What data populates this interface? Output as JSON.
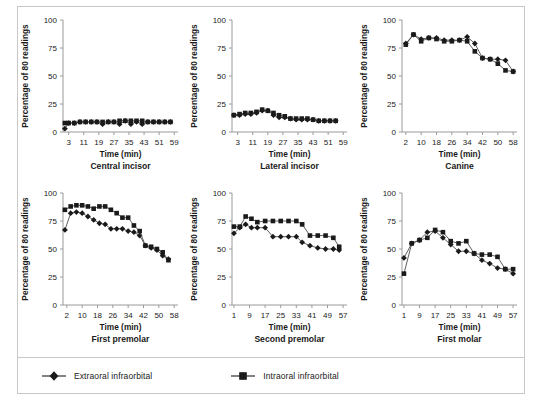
{
  "figure": {
    "ylabel": "Percentage of 80 readings",
    "xlabel": "Time (min)",
    "yticks": [
      "0",
      "25",
      "50",
      "75",
      "100"
    ],
    "ylim": [
      0,
      100
    ],
    "colors": {
      "line": "#4d4d4d",
      "marker": "#1a1a1a",
      "axis": "#9a9a9a",
      "text": "#1a1a1a",
      "border": "#c8c8c8",
      "background": "#ffffff"
    }
  },
  "legend": {
    "position": "bottom",
    "items": [
      {
        "label": "Extraoral infraorbital",
        "marker": "diamond"
      },
      {
        "label": "Intraoral infraorbital",
        "marker": "square"
      }
    ]
  },
  "chart_data": [
    {
      "type": "line",
      "title": "Central incisor",
      "xlabel": "Time (min)",
      "ylabel": "Percentage of 80 readings",
      "ylim": [
        0,
        100
      ],
      "xlim": [
        0,
        61
      ],
      "xticks": [
        3,
        11,
        19,
        27,
        35,
        43,
        51,
        59
      ],
      "yticks": [
        0,
        25,
        50,
        75,
        100
      ],
      "grid": false,
      "x": [
        1,
        3,
        6,
        9,
        12,
        15,
        18,
        21,
        24,
        27,
        30,
        33,
        36,
        39,
        42,
        45,
        48,
        51,
        54,
        57
      ],
      "series": [
        {
          "name": "Extraoral infraorbital",
          "marker": "diamond",
          "values": [
            3,
            8,
            8,
            9,
            9,
            9,
            9,
            7,
            9,
            9,
            7,
            10,
            7,
            9,
            7,
            9,
            9,
            9,
            9,
            9
          ]
        },
        {
          "name": "Intraoral infraorbital",
          "marker": "square",
          "values": [
            8,
            8,
            8,
            9,
            9,
            9,
            9,
            9,
            9,
            9,
            10,
            10,
            10,
            10,
            10,
            9,
            9,
            9,
            9,
            9
          ]
        }
      ]
    },
    {
      "type": "line",
      "title": "Lateral incisor",
      "xlabel": "Time (min)",
      "ylabel": "Percentage of 80 readings",
      "ylim": [
        0,
        100
      ],
      "xlim": [
        0,
        61
      ],
      "xticks": [
        3,
        11,
        19,
        27,
        35,
        43,
        51,
        59
      ],
      "yticks": [
        0,
        25,
        50,
        75,
        100
      ],
      "grid": false,
      "x": [
        1,
        4,
        7,
        10,
        13,
        16,
        19,
        22,
        25,
        28,
        31,
        34,
        37,
        40,
        43,
        46,
        49,
        52,
        55
      ],
      "series": [
        {
          "name": "Extraoral infraorbital",
          "marker": "diamond",
          "values": [
            15,
            15,
            16,
            16,
            17,
            19,
            19,
            15,
            13,
            13,
            12,
            11,
            11,
            11,
            11,
            10,
            10,
            10,
            10
          ]
        },
        {
          "name": "Intraoral infraorbital",
          "marker": "square",
          "values": [
            15,
            16,
            17,
            17,
            18,
            20,
            19,
            17,
            15,
            14,
            12,
            12,
            12,
            12,
            11,
            10,
            10,
            10,
            10
          ]
        }
      ]
    },
    {
      "type": "line",
      "title": "Canine",
      "xlabel": "Time (min)",
      "ylabel": "Percentage of 80 readings",
      "ylim": [
        0,
        100
      ],
      "xlim": [
        0,
        60
      ],
      "xticks": [
        2,
        10,
        18,
        26,
        34,
        42,
        50,
        58
      ],
      "yticks": [
        0,
        25,
        50,
        75,
        100
      ],
      "grid": false,
      "x": [
        2,
        6,
        10,
        14,
        18,
        22,
        26,
        30,
        34,
        38,
        42,
        46,
        50,
        54,
        58
      ],
      "series": [
        {
          "name": "Extraoral infraorbital",
          "marker": "diamond",
          "values": [
            79,
            87,
            83,
            84,
            84,
            82,
            82,
            82,
            85,
            79,
            66,
            65,
            65,
            64,
            54
          ]
        },
        {
          "name": "Intraoral infraorbital",
          "marker": "square",
          "values": [
            78,
            87,
            81,
            84,
            83,
            81,
            81,
            82,
            81,
            72,
            66,
            65,
            61,
            55,
            54
          ]
        }
      ]
    },
    {
      "type": "line",
      "title": "First premolar",
      "xlabel": "Time (min)",
      "ylabel": "Percentage of 80 readings",
      "ylim": [
        0,
        100
      ],
      "xlim": [
        0,
        60
      ],
      "xticks": [
        2,
        10,
        18,
        26,
        34,
        42,
        50,
        58
      ],
      "yticks": [
        0,
        25,
        50,
        75,
        100
      ],
      "grid": false,
      "x": [
        1,
        4,
        7,
        10,
        13,
        16,
        19,
        22,
        25,
        28,
        31,
        34,
        37,
        40,
        43,
        46,
        49,
        52,
        55
      ],
      "series": [
        {
          "name": "Extraoral infraorbital",
          "marker": "diamond",
          "values": [
            67,
            82,
            83,
            82,
            79,
            76,
            73,
            72,
            68,
            68,
            68,
            66,
            65,
            62,
            53,
            51,
            49,
            44,
            41
          ]
        },
        {
          "name": "Intraoral infraorbital",
          "marker": "square",
          "values": [
            85,
            88,
            89,
            89,
            88,
            86,
            88,
            88,
            85,
            82,
            78,
            78,
            71,
            66,
            53,
            52,
            50,
            47,
            40
          ]
        }
      ]
    },
    {
      "type": "line",
      "title": "Second premolar",
      "xlabel": "Time (min)",
      "ylabel": "Percentage of 80 readings",
      "ylim": [
        0,
        100
      ],
      "xlim": [
        0,
        59
      ],
      "xticks": [
        1,
        9,
        17,
        25,
        33,
        41,
        49,
        57
      ],
      "yticks": [
        0,
        25,
        50,
        75,
        100
      ],
      "grid": false,
      "x": [
        1,
        4,
        7,
        10,
        13,
        17,
        21,
        25,
        29,
        33,
        36,
        40,
        44,
        48,
        52,
        55
      ],
      "series": [
        {
          "name": "Extraoral infraorbital",
          "marker": "diamond",
          "values": [
            64,
            69,
            72,
            69,
            69,
            69,
            61,
            61,
            61,
            61,
            56,
            53,
            51,
            50,
            50,
            49
          ]
        },
        {
          "name": "Intraoral infraorbital",
          "marker": "square",
          "values": [
            70,
            70,
            79,
            77,
            74,
            75,
            75,
            75,
            75,
            75,
            72,
            62,
            62,
            62,
            60,
            52
          ]
        }
      ]
    },
    {
      "type": "line",
      "title": "First molar",
      "xlabel": "Time (min)",
      "ylabel": "Percentage of 80 readings",
      "ylim": [
        0,
        100
      ],
      "xlim": [
        0,
        59
      ],
      "xticks": [
        1,
        9,
        17,
        25,
        33,
        41,
        49,
        57
      ],
      "yticks": [
        0,
        25,
        50,
        75,
        100
      ],
      "grid": false,
      "x": [
        1,
        5,
        9,
        13,
        17,
        21,
        25,
        29,
        33,
        37,
        41,
        45,
        49,
        53,
        57
      ],
      "series": [
        {
          "name": "Extraoral infraorbital",
          "marker": "diamond",
          "values": [
            42,
            55,
            58,
            65,
            66,
            60,
            54,
            48,
            48,
            46,
            40,
            37,
            33,
            32,
            28
          ]
        },
        {
          "name": "Intraoral infraorbital",
          "marker": "square",
          "values": [
            28,
            55,
            58,
            60,
            67,
            65,
            57,
            55,
            57,
            46,
            45,
            45,
            43,
            32,
            32
          ]
        }
      ]
    }
  ]
}
